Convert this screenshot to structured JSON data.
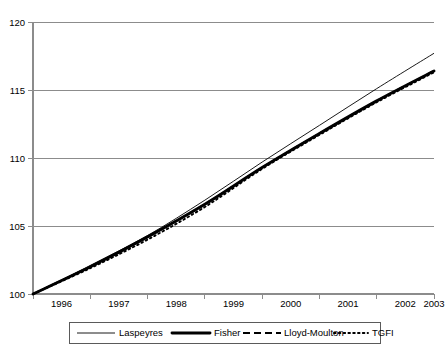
{
  "chart_data": {
    "type": "line",
    "title": "",
    "xlabel": "",
    "ylabel": "",
    "grid": true,
    "legend_position": "bottom",
    "x": [
      1996,
      1997,
      1998,
      1999,
      2000,
      2001,
      2002,
      2003
    ],
    "xtick_labels": [
      "1996",
      "1997",
      "1998",
      "1999",
      "2000",
      "2001",
      "2002",
      "2003"
    ],
    "ytick_labels": [
      "100",
      "105",
      "110",
      "115",
      "120"
    ],
    "yticks": [
      100,
      105,
      110,
      115,
      120
    ],
    "xlim": [
      1996,
      2003
    ],
    "ylim": [
      100,
      120
    ],
    "series": [
      {
        "name": "Laspeyres",
        "style": "thin-solid",
        "values": [
          100.0,
          102.1,
          104.3,
          106.9,
          109.7,
          112.4,
          115.1,
          117.7
        ]
      },
      {
        "name": "Fisher",
        "style": "thick-solid",
        "values": [
          100.0,
          102.0,
          104.2,
          106.6,
          109.3,
          111.8,
          114.2,
          116.4
        ]
      },
      {
        "name": "Lloyd-Moulton",
        "style": "dashed",
        "values": [
          100.0,
          102.0,
          104.2,
          106.6,
          109.3,
          111.8,
          114.2,
          116.4
        ]
      },
      {
        "name": "TGFI",
        "style": "dotted",
        "values": [
          100.0,
          101.9,
          104.0,
          106.4,
          109.2,
          111.7,
          114.1,
          116.3
        ]
      }
    ]
  },
  "legend": {
    "items": [
      {
        "label": "Laspeyres",
        "marker": "thin-solid-line"
      },
      {
        "label": "Fisher",
        "marker": "thick-solid-line"
      },
      {
        "label": "Lloyd-Moulton",
        "marker": "dashed-line"
      },
      {
        "label": "TGFI",
        "marker": "dotted-line"
      }
    ]
  }
}
